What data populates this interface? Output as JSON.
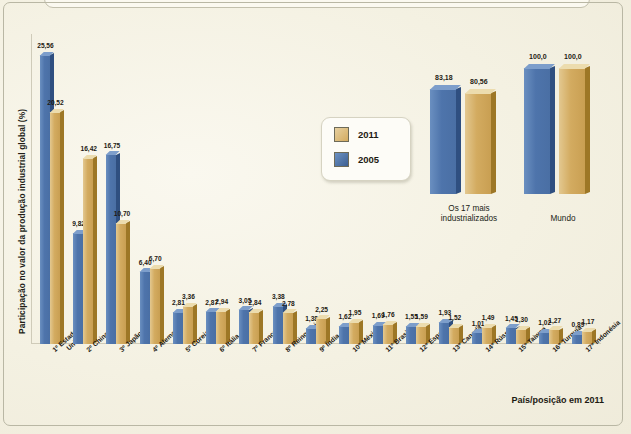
{
  "figure": {
    "ylabel": "Participação no valor da produção industrial global (%)",
    "footnote": "País/posição em 2011",
    "colors": {
      "series_2011": "#d3ab60",
      "series_2005": "#4e74ab",
      "background": "#f4f1e2"
    }
  },
  "legend": {
    "items": [
      {
        "label": "2011",
        "color": "#d3ab60"
      },
      {
        "label": "2005",
        "color": "#4e74ab"
      }
    ]
  },
  "chart_data": {
    "type": "bar",
    "title": "",
    "xlabel": "País/posição em 2011",
    "ylabel": "Participação no valor da produção industrial global (%)",
    "ylim": [
      0,
      26
    ],
    "grid": false,
    "legend_position": "center",
    "categories": [
      "1º Estados Unidos",
      "2º China",
      "3º Japão",
      "4º Alemanha",
      "5º Coreia do Sul",
      "6º Itália",
      "7º França",
      "8º Reino Unido",
      "9º Índia",
      "10º México",
      "11º Brasil",
      "12º Espanha",
      "13º Canadá",
      "14º Rússia",
      "15º Taiwan",
      "16º Turquia",
      "17º Indonésia"
    ],
    "series": [
      {
        "name": "2005",
        "color": "#4e74ab",
        "values": [
          25.56,
          9.82,
          16.75,
          6.4,
          2.81,
          2.87,
          3.05,
          3.38,
          1.38,
          1.62,
          1.69,
          1.55,
          1.93,
          1.01,
          1.45,
          1.02,
          0.89
        ],
        "labels": [
          "25,56",
          "9,82",
          "16,75",
          "6,40",
          "2,81",
          "2,87",
          "3,05",
          "3,38",
          "1,38",
          "1,62",
          "1,69",
          "1,55",
          "1,93",
          "1,01",
          "1,45",
          "1,02",
          "0,89"
        ]
      },
      {
        "name": "2011",
        "color": "#d3ab60",
        "values": [
          20.52,
          16.42,
          10.7,
          6.7,
          3.36,
          2.94,
          2.84,
          2.78,
          2.25,
          1.95,
          1.76,
          1.59,
          1.52,
          1.49,
          1.3,
          1.27,
          1.17
        ],
        "labels": [
          "20,52",
          "16,42",
          "10,70",
          "6,70",
          "3,36",
          "2,94",
          "2,84",
          "2,78",
          "2,25",
          "1,95",
          "1,76",
          "1,59",
          "1,52",
          "1,49",
          "1,30",
          "1,27",
          "1,17"
        ]
      }
    ]
  },
  "inset_chart": {
    "type": "bar",
    "ylim": [
      0,
      100
    ],
    "categories": [
      "Os 17 mais industrializados",
      "Mundo"
    ],
    "category_lines": [
      [
        "Os 17 mais",
        "industrializados"
      ],
      [
        "Mundo",
        ""
      ]
    ],
    "series": [
      {
        "name": "2005",
        "color": "#4e74ab",
        "values": [
          83.18,
          100.0
        ],
        "labels": [
          "83,18",
          "100,0"
        ]
      },
      {
        "name": "2011",
        "color": "#d3ab60",
        "values": [
          80.56,
          100.0
        ],
        "labels": [
          "80,56",
          "100,0"
        ]
      }
    ]
  }
}
